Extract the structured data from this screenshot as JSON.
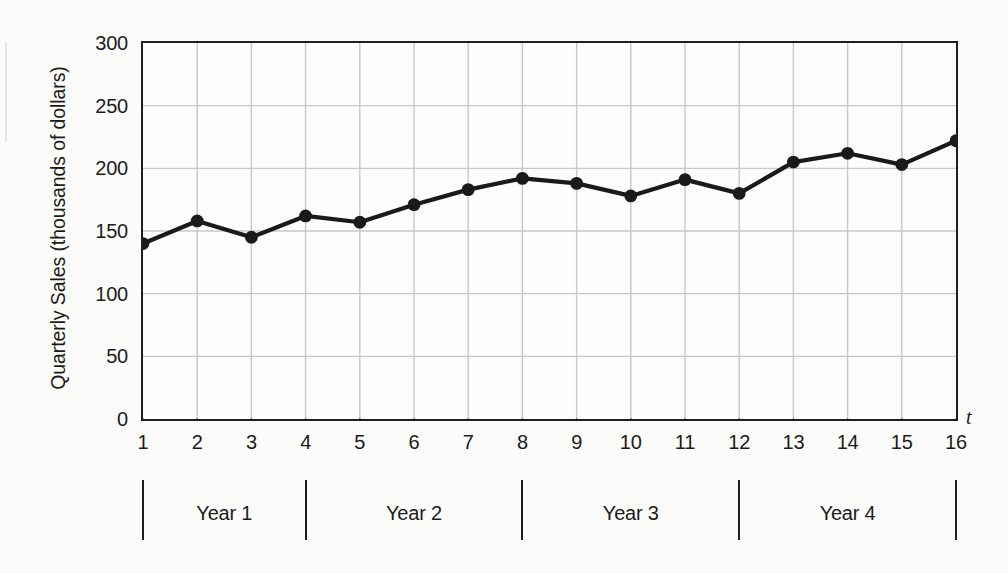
{
  "chart_data": {
    "type": "line",
    "title": "",
    "xlabel": "t",
    "ylabel": "Quarterly Sales (thousands of dollars)",
    "x": [
      1,
      2,
      3,
      4,
      5,
      6,
      7,
      8,
      9,
      10,
      11,
      12,
      13,
      14,
      15,
      16
    ],
    "values": [
      140,
      158,
      145,
      162,
      157,
      171,
      183,
      192,
      188,
      178,
      191,
      180,
      205,
      212,
      203,
      222
    ],
    "series": [
      {
        "name": "Quarterly Sales",
        "values": [
          140,
          158,
          145,
          162,
          157,
          171,
          183,
          192,
          188,
          178,
          191,
          180,
          205,
          212,
          203,
          222
        ]
      }
    ],
    "x_tick_labels": [
      "1",
      "2",
      "3",
      "4",
      "5",
      "6",
      "7",
      "8",
      "9",
      "10",
      "11",
      "12",
      "13",
      "14",
      "15",
      "16"
    ],
    "y_tick_labels": [
      "0",
      "50",
      "100",
      "150",
      "200",
      "250",
      "300"
    ],
    "y_ticks": [
      0,
      50,
      100,
      150,
      200,
      250,
      300
    ],
    "ylim": [
      0,
      300
    ],
    "xlim": [
      1,
      16
    ],
    "grid": true,
    "legend": "none",
    "marker": "filled-circle",
    "line_color": "#1a1a1a",
    "marker_color": "#1a1a1a",
    "grid_color": "#c8c8c8",
    "axis_color": "#1e1e1e",
    "background_color": "#fbfbfa",
    "groups": [
      {
        "label": "Year 1",
        "start": 1,
        "end": 4
      },
      {
        "label": "Year 2",
        "start": 4,
        "end": 8
      },
      {
        "label": "Year 3",
        "start": 8,
        "end": 12
      },
      {
        "label": "Year 4",
        "start": 12,
        "end": 16
      }
    ],
    "group_separators": [
      1,
      4,
      8,
      12,
      16
    ]
  }
}
